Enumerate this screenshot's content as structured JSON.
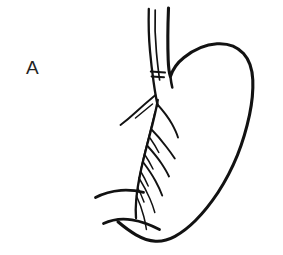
{
  "figure": {
    "panel_label": "A",
    "caption": "",
    "background_color": "#ffffff",
    "ink_color": "#121212",
    "label_color": "#242424",
    "canvas": {
      "width": 283,
      "height": 255
    }
  },
  "anatomy": {
    "parts": [
      {
        "id": "esophagus-wall",
        "label": "esophagus"
      },
      {
        "id": "stomach-fundus",
        "label": "fundus"
      },
      {
        "id": "stomach-greater-curvature",
        "label": "greater curvature"
      },
      {
        "id": "stomach-lesser-curvature",
        "label": "lesser curvature"
      },
      {
        "id": "duodenum",
        "label": "duodenum"
      },
      {
        "id": "vagus-nerve-trunk",
        "label": "anterior vagal trunk"
      },
      {
        "id": "nerve-of-latarjet",
        "label": "nerve of Latarjet"
      },
      {
        "id": "crows-foot-branches",
        "label": "crow's foot branches"
      },
      {
        "id": "ligature-mark",
        "label": "transection / ligature mark"
      }
    ]
  }
}
